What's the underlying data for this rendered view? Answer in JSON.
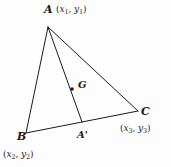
{
  "figure": {
    "kind": "geometry-diagram",
    "background_color": "#fdfdfd",
    "stroke_color": "#1b1b1b",
    "text_color": "#1b1b1b"
  },
  "labels": {
    "vertex_a": "A",
    "vertex_a_coords": "(x1, y1)",
    "vertex_a_coord_x": "x",
    "vertex_a_coord_x_sub": "1",
    "vertex_a_coord_y": "y",
    "vertex_a_coord_y_sub": "1",
    "vertex_b": "B",
    "vertex_b_coords": "(x2, y2)",
    "vertex_b_coord_x": "x",
    "vertex_b_coord_x_sub": "2",
    "vertex_b_coord_y": "y",
    "vertex_b_coord_y_sub": "2",
    "vertex_c": "C",
    "vertex_c_coords": "(x3, y3)",
    "vertex_c_coord_x": "x",
    "vertex_c_coord_x_sub": "3",
    "vertex_c_coord_y": "y",
    "vertex_c_coord_y_sub": "3",
    "centroid": "G",
    "midpoint_a": "A'"
  },
  "geometry": {
    "points": {
      "A": {
        "x": 48,
        "y": 27
      },
      "B": {
        "x": 26,
        "y": 133
      },
      "C": {
        "x": 138,
        "y": 111
      },
      "A_prime": {
        "x": 82,
        "y": 122
      },
      "G": {
        "x": 72,
        "y": 89
      }
    },
    "segments": [
      {
        "name": "side-ab",
        "from": "A",
        "to": "B"
      },
      {
        "name": "side-bc",
        "from": "B",
        "to": "C"
      },
      {
        "name": "side-ca",
        "from": "C",
        "to": "A"
      },
      {
        "name": "median-a-aprime",
        "from": "A",
        "to": "A_prime"
      }
    ],
    "dot_radius": 1.8,
    "stroke_width": 1.0
  }
}
